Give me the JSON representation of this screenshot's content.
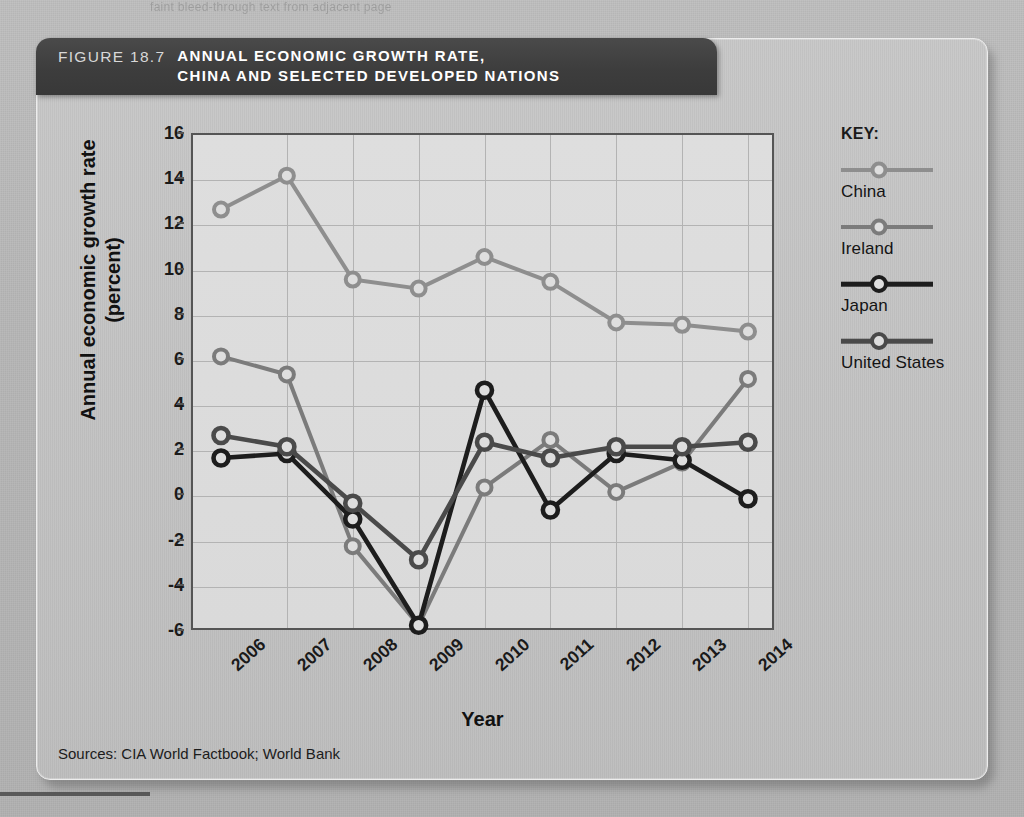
{
  "page": {
    "ghost_top_text": "faint bleed-through text from adjacent page",
    "background_color": "#b9b9b9"
  },
  "figure": {
    "number_label": "FIGURE 18.7",
    "title_line1": "ANNUAL ECONOMIC GROWTH RATE,",
    "title_line2": "CHINA AND SELECTED DEVELOPED NATIONS",
    "header_bg": "#3d3d3d",
    "source": "Sources: CIA World Factbook; World Bank"
  },
  "legend": {
    "title": "KEY:",
    "items": [
      {
        "label": "China",
        "color": "#8e8e8e",
        "width": 4.0,
        "marker": 9
      },
      {
        "label": "Ireland",
        "color": "#7b7b7b",
        "width": 4.0,
        "marker": 9
      },
      {
        "label": "Japan",
        "color": "#1d1d1d",
        "width": 4.6,
        "marker": 10
      },
      {
        "label": "United States",
        "color": "#4a4a4a",
        "width": 4.6,
        "marker": 10
      }
    ]
  },
  "chart_data": {
    "type": "line",
    "title": "ANNUAL ECONOMIC GROWTH RATE, CHINA AND SELECTED DEVELOPED NATIONS",
    "xlabel": "Year",
    "ylabel": "Annual economic growth rate (percent)",
    "ylabel_line1": "Annual economic growth rate",
    "ylabel_line2": "(percent)",
    "categories": [
      "2006",
      "2007",
      "2008",
      "2009",
      "2010",
      "2011",
      "2012",
      "2013",
      "2014"
    ],
    "x": [
      2006,
      2007,
      2008,
      2009,
      2010,
      2011,
      2012,
      2013,
      2014
    ],
    "ylim": [
      -6,
      16
    ],
    "ytick_values": [
      16,
      14,
      12,
      10,
      8,
      6,
      4,
      2,
      0,
      -2,
      -4,
      -6
    ],
    "ytick_labels": [
      "16",
      "14",
      "12",
      "10",
      "8",
      "6",
      "4",
      "2",
      "0",
      "-2",
      "-4",
      "-6"
    ],
    "grid": true,
    "legend_position": "right",
    "series": [
      {
        "name": "China",
        "color": "#8e8e8e",
        "line_width": 4.0,
        "marker_radius": 7,
        "values": [
          12.7,
          14.2,
          9.6,
          9.2,
          10.6,
          9.5,
          7.7,
          7.6,
          7.3
        ]
      },
      {
        "name": "Ireland",
        "color": "#7b7b7b",
        "line_width": 4.0,
        "marker_radius": 7,
        "values": [
          6.2,
          5.4,
          -2.2,
          -5.7,
          0.4,
          2.5,
          0.2,
          1.5,
          5.2
        ]
      },
      {
        "name": "Japan",
        "color": "#1d1d1d",
        "line_width": 4.6,
        "marker_radius": 7.5,
        "values": [
          1.7,
          1.9,
          -1.0,
          -5.7,
          4.7,
          -0.6,
          1.9,
          1.6,
          -0.1
        ]
      },
      {
        "name": "United States",
        "color": "#4a4a4a",
        "line_width": 4.6,
        "marker_radius": 7.5,
        "values": [
          2.7,
          2.2,
          -0.3,
          -2.8,
          2.4,
          1.7,
          2.2,
          2.2,
          2.4
        ]
      }
    ]
  }
}
